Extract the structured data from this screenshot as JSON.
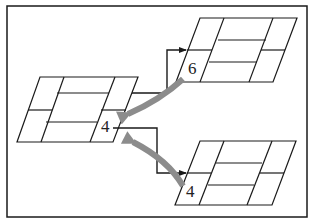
{
  "diagram": {
    "colors": {
      "line": "#1a1a1a",
      "curved_arrow": "#8c8c8c",
      "background": "#ffffff"
    },
    "blocks": [
      {
        "id": "left",
        "label": "4"
      },
      {
        "id": "top-right",
        "label": "6"
      },
      {
        "id": "bottom-right",
        "label": "4"
      }
    ]
  }
}
